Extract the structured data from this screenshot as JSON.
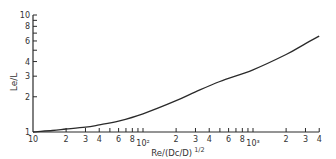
{
  "chart_data": {
    "type": "line",
    "title": "",
    "xlabel": "Re/(Dc/D)^1/2",
    "ylabel": "Le/L",
    "xscale": "log",
    "yscale": "log",
    "xlim": [
      10,
      4000
    ],
    "ylim": [
      1,
      10
    ],
    "grid": false,
    "legend": null,
    "x_ticks": [
      {
        "value": 10,
        "label": "10"
      },
      {
        "value": 20,
        "label": "2"
      },
      {
        "value": 30,
        "label": "3"
      },
      {
        "value": 40,
        "label": "4"
      },
      {
        "value": 50,
        "label": ""
      },
      {
        "value": 60,
        "label": "6"
      },
      {
        "value": 70,
        "label": ""
      },
      {
        "value": 80,
        "label": "8"
      },
      {
        "value": 90,
        "label": ""
      },
      {
        "value": 100,
        "label": "10²"
      },
      {
        "value": 200,
        "label": "2"
      },
      {
        "value": 300,
        "label": "3"
      },
      {
        "value": 400,
        "label": "4"
      },
      {
        "value": 500,
        "label": ""
      },
      {
        "value": 600,
        "label": "6"
      },
      {
        "value": 700,
        "label": ""
      },
      {
        "value": 800,
        "label": "8"
      },
      {
        "value": 900,
        "label": ""
      },
      {
        "value": 1000,
        "label": "10³"
      },
      {
        "value": 2000,
        "label": "2"
      },
      {
        "value": 3000,
        "label": "3"
      },
      {
        "value": 4000,
        "label": "4"
      }
    ],
    "y_ticks": [
      {
        "value": 1,
        "label": "1"
      },
      {
        "value": 2,
        "label": "2"
      },
      {
        "value": 3,
        "label": "3"
      },
      {
        "value": 4,
        "label": "4"
      },
      {
        "value": 5,
        "label": ""
      },
      {
        "value": 6,
        "label": "6"
      },
      {
        "value": 7,
        "label": ""
      },
      {
        "value": 8,
        "label": "8"
      },
      {
        "value": 9,
        "label": ""
      },
      {
        "value": 10,
        "label": "10"
      }
    ],
    "series": [
      {
        "name": "Le/L",
        "x": [
          10,
          15,
          20,
          30,
          40,
          60,
          100,
          200,
          300,
          500,
          1000,
          2000,
          3000,
          4000
        ],
        "y": [
          1.0,
          1.03,
          1.06,
          1.1,
          1.15,
          1.24,
          1.43,
          1.85,
          2.2,
          2.7,
          3.4,
          4.6,
          5.7,
          6.6
        ]
      }
    ]
  }
}
